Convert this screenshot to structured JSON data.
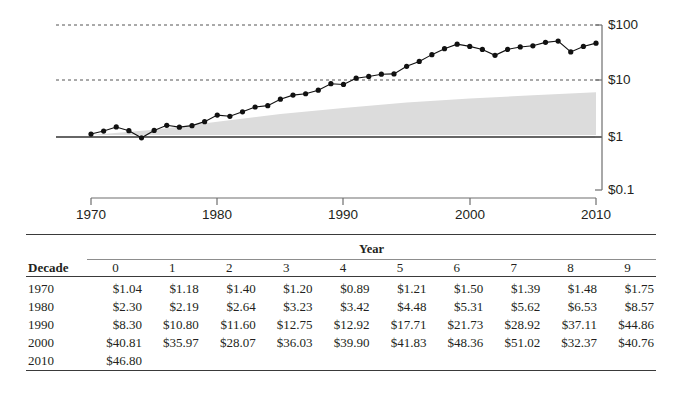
{
  "chart_data": {
    "type": "line",
    "title": "",
    "xlabel": "",
    "ylabel": "",
    "yscale": "log",
    "ylim": [
      0.1,
      100
    ],
    "xlim": [
      1970,
      2010
    ],
    "grid": "horizontal-dashed at $10 and $100; solid baseline at $1",
    "y_tick_labels": [
      "$100",
      "$10",
      "$1",
      "$0.1"
    ],
    "y_tick_values": [
      100,
      10,
      1,
      0.1
    ],
    "x_tick_labels": [
      "1970",
      "1980",
      "1990",
      "2000",
      "2010"
    ],
    "x_tick_values": [
      1970,
      1980,
      1990,
      2000,
      2010
    ],
    "series": [
      {
        "name": "value",
        "marker": "filled-circle",
        "x": [
          1970,
          1971,
          1972,
          1973,
          1974,
          1975,
          1976,
          1977,
          1978,
          1979,
          1980,
          1981,
          1982,
          1983,
          1984,
          1985,
          1986,
          1987,
          1988,
          1989,
          1990,
          1991,
          1992,
          1993,
          1994,
          1995,
          1996,
          1997,
          1998,
          1999,
          2000,
          2001,
          2002,
          2003,
          2004,
          2005,
          2006,
          2007,
          2008,
          2009,
          2010
        ],
        "values": [
          1.04,
          1.18,
          1.4,
          1.2,
          0.89,
          1.21,
          1.5,
          1.39,
          1.48,
          1.75,
          2.3,
          2.19,
          2.64,
          3.23,
          3.42,
          4.48,
          5.31,
          5.62,
          6.53,
          8.57,
          8.3,
          10.8,
          11.6,
          12.75,
          12.92,
          17.71,
          21.73,
          28.92,
          37.11,
          44.86,
          40.81,
          35.97,
          28.07,
          36.03,
          39.9,
          41.83,
          48.36,
          51.02,
          32.37,
          40.76,
          46.8
        ]
      },
      {
        "name": "shaded-band",
        "type": "area",
        "x": [
          1970,
          1975,
          1980,
          1985,
          1990,
          1995,
          2000,
          2005,
          2010
        ],
        "upper": [
          1.0,
          1.25,
          1.75,
          2.4,
          3.1,
          3.9,
          4.6,
          5.3,
          6.0
        ],
        "lower": [
          1,
          1,
          1,
          1,
          1,
          1,
          1,
          1,
          1
        ]
      }
    ]
  },
  "table": {
    "year_header": "Year",
    "decade_header": "Decade",
    "columns": [
      "0",
      "1",
      "2",
      "3",
      "4",
      "5",
      "6",
      "7",
      "8",
      "9"
    ],
    "rows": [
      {
        "decade": "1970",
        "values": [
          "$1.04",
          "$1.18",
          "$1.40",
          "$1.20",
          "$0.89",
          "$1.21",
          "$1.50",
          "$1.39",
          "$1.48",
          "$1.75"
        ]
      },
      {
        "decade": "1980",
        "values": [
          "$2.30",
          "$2.19",
          "$2.64",
          "$3.23",
          "$3.42",
          "$4.48",
          "$5.31",
          "$5.62",
          "$6.53",
          "$8.57"
        ]
      },
      {
        "decade": "1990",
        "values": [
          "$8.30",
          "$10.80",
          "$11.60",
          "$12.75",
          "$12.92",
          "$17.71",
          "$21.73",
          "$28.92",
          "$37.11",
          "$44.86"
        ]
      },
      {
        "decade": "2000",
        "values": [
          "$40.81",
          "$35.97",
          "$28.07",
          "$36.03",
          "$39.90",
          "$41.83",
          "$48.36",
          "$51.02",
          "$32.37",
          "$40.76"
        ]
      },
      {
        "decade": "2010",
        "values": [
          "$46.80",
          "",
          "",
          "",
          "",
          "",
          "",
          "",
          "",
          ""
        ]
      }
    ]
  },
  "colors": {
    "ink": "#231f20",
    "rule": "#3a3a3a",
    "grid": "#555555",
    "band": "#dcdcdc",
    "axis": "#6e6e6e"
  }
}
